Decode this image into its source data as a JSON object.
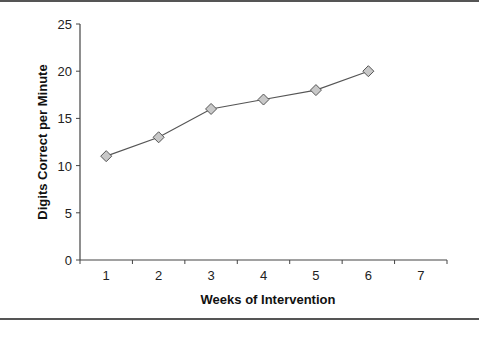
{
  "chart_data": {
    "type": "line",
    "title": "",
    "xlabel": "Weeks of Intervention",
    "ylabel": "Digits Correct per Minute",
    "x_ticks": [
      "1",
      "2",
      "3",
      "4",
      "5",
      "6",
      "7"
    ],
    "y_ticks": [
      "0",
      "5",
      "10",
      "15",
      "20",
      "25"
    ],
    "ylim": [
      0,
      25
    ],
    "xlim": [
      0.5,
      7.5
    ],
    "grid": false,
    "legend": null,
    "series": [
      {
        "name": "Digits Correct per Minute",
        "marker": "diamond",
        "color": "#c8c8c8",
        "line_color": "#555555",
        "x": [
          1,
          2,
          3,
          4,
          5,
          6
        ],
        "values": [
          11,
          13,
          16,
          17,
          18,
          20
        ]
      }
    ]
  }
}
